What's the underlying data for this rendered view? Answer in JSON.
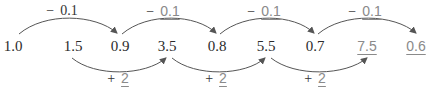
{
  "sequence": {
    "terms": [
      {
        "value": "1.0",
        "x": 13,
        "answer": false
      },
      {
        "value": "1.5",
        "x": 73,
        "answer": false
      },
      {
        "value": "0.9",
        "x": 120,
        "answer": false
      },
      {
        "value": "3.5",
        "x": 167,
        "answer": false
      },
      {
        "value": "0.8",
        "x": 217,
        "answer": false
      },
      {
        "value": "5.5",
        "x": 266,
        "answer": false
      },
      {
        "value": "0.7",
        "x": 315,
        "answer": false
      },
      {
        "value": "7.5",
        "x": 367,
        "answer": true
      },
      {
        "value": "0.6",
        "x": 416,
        "answer": true
      }
    ],
    "top_labels": [
      {
        "op": "−",
        "value": "0.1",
        "x": 62,
        "answer": false
      },
      {
        "op": "−",
        "value": "0.1",
        "x": 163,
        "answer": true
      },
      {
        "op": "−",
        "value": "0.1",
        "x": 264,
        "answer": true
      },
      {
        "op": "−",
        "value": "0.1",
        "x": 365,
        "answer": true
      }
    ],
    "bottom_labels": [
      {
        "op": "+",
        "value": "2",
        "x": 118,
        "answer": true
      },
      {
        "op": "+",
        "value": "2",
        "x": 216,
        "answer": true
      },
      {
        "op": "+",
        "value": "2",
        "x": 315,
        "answer": true
      }
    ]
  },
  "colors": {
    "text": "#2b2b2b",
    "answer": "#8a8a8a",
    "arrow": "#555555"
  }
}
